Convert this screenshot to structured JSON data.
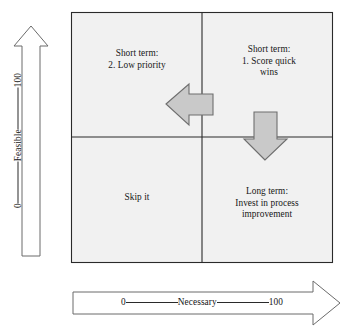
{
  "diagram": {
    "type": "2x2-matrix",
    "background_color": "#f1f1f1",
    "border_color": "#2a2a2a",
    "arrow_fill": "#c9c9c9",
    "arrow_stroke": "#6e6e6e"
  },
  "quadrants": {
    "top_left": {
      "line1": "Short term:",
      "line2": "2. Low priority"
    },
    "top_right": {
      "line1": "Short term:",
      "line2": "1. Score quick",
      "line3": "wins"
    },
    "bottom_left": {
      "line1": "Skip it"
    },
    "bottom_right": {
      "line1": "Long term:",
      "line2": "Invest in process",
      "line3": "improvement"
    }
  },
  "axes": {
    "x": {
      "label": "Necessary",
      "min": "0",
      "max": "100",
      "direction": "right"
    },
    "y": {
      "label": "Feasible",
      "min": "0",
      "max": "100",
      "direction": "up"
    }
  },
  "flow_arrows": [
    {
      "name": "left-arrow",
      "direction": "left",
      "from_quadrant": "top_right",
      "to_quadrant": "top_left"
    },
    {
      "name": "down-arrow",
      "direction": "down",
      "from_quadrant": "top_right",
      "to_quadrant": "bottom_right"
    }
  ]
}
